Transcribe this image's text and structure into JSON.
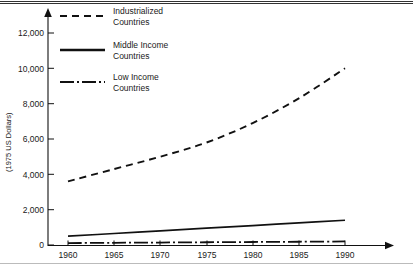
{
  "chart_data": {
    "type": "line",
    "title": "",
    "subtitle": "",
    "xlabel": "",
    "ylabel": "(1975 US Dollars)",
    "x": [
      1960,
      1965,
      1970,
      1975,
      1980,
      1985,
      1990
    ],
    "xlim": [
      1960,
      1990
    ],
    "ylim": [
      0,
      13000
    ],
    "yticks": [
      0,
      2000,
      4000,
      6000,
      8000,
      10000,
      12000
    ],
    "ytick_labels": [
      "0",
      "2,000",
      "4,000",
      "6,000",
      "8,000",
      "10,000",
      "12,000"
    ],
    "xtick_labels": [
      "1960",
      "1965",
      "1970",
      "1975",
      "1980",
      "1985",
      "1990"
    ],
    "grid": false,
    "legend_position": "top-left-inside",
    "series": [
      {
        "name": "Industrialized Countries",
        "style": "dashed",
        "color": "#111111",
        "values": [
          3600,
          4300,
          5000,
          5800,
          6900,
          8300,
          10000
        ]
      },
      {
        "name": "Middle Income Countries",
        "style": "solid",
        "color": "#111111",
        "values": [
          500,
          650,
          800,
          950,
          1100,
          1250,
          1400
        ]
      },
      {
        "name": "Low Income Countries",
        "style": "dash-dot",
        "color": "#111111",
        "values": [
          110,
          125,
          140,
          155,
          170,
          185,
          200
        ]
      }
    ]
  },
  "legend": {
    "entries": [
      {
        "label_line1": "Industrialized",
        "label_line2": "Countries",
        "style": "dashed"
      },
      {
        "label_line1": "Middle Income",
        "label_line2": "Countries",
        "style": "solid"
      },
      {
        "label_line1": "Low Income",
        "label_line2": "Countries",
        "style": "dash-dot"
      }
    ]
  },
  "axes": {
    "y_title": "(1975 US Dollars)",
    "y_tick_labels": [
      "12,000",
      "10,000",
      "8,000",
      "6,000",
      "4,000",
      "2,000",
      "0"
    ],
    "x_tick_labels": [
      "1960",
      "1965",
      "1970",
      "1975",
      "1980",
      "1985",
      "1990"
    ]
  }
}
